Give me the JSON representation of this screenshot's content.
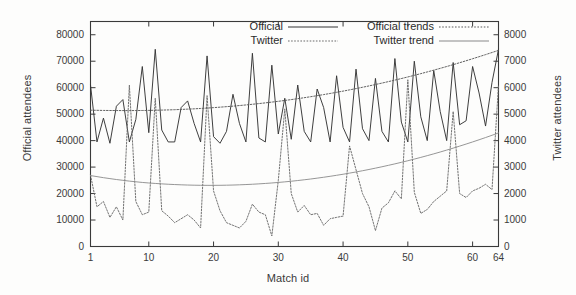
{
  "chart_data": {
    "type": "line",
    "title": "",
    "xlabel": "Match id",
    "ylabel": "Official attendees",
    "ylabel_right": "Twitter attendees",
    "xlim": [
      1,
      64
    ],
    "ylim": [
      0,
      85000
    ],
    "ylim_right": [
      0,
      8500
    ],
    "grid": false,
    "legend_position": "top-center-inside",
    "xticks": [
      1,
      10,
      20,
      30,
      40,
      50,
      60,
      64
    ],
    "xticklabels": [
      "1",
      "10",
      "20",
      "30",
      "40",
      "50",
      "60",
      "64"
    ],
    "yticks_left": [
      0,
      10000,
      20000,
      30000,
      40000,
      50000,
      60000,
      70000,
      80000
    ],
    "yticklabels_left": [
      "0",
      "10000",
      "20000",
      "30000",
      "40000",
      "50000",
      "60000",
      "70000",
      "80000"
    ],
    "yticks_right": [
      0,
      1000,
      2000,
      3000,
      4000,
      5000,
      6000,
      7000,
      8000
    ],
    "yticklabels_right": [
      "0",
      "1000",
      "2000",
      "3000",
      "4000",
      "5000",
      "6000",
      "7000",
      "8000"
    ],
    "x": [
      1,
      2,
      3,
      4,
      5,
      6,
      7,
      8,
      9,
      10,
      11,
      12,
      13,
      14,
      15,
      16,
      17,
      18,
      19,
      20,
      21,
      22,
      23,
      24,
      25,
      26,
      27,
      28,
      29,
      30,
      31,
      32,
      33,
      34,
      35,
      36,
      37,
      38,
      39,
      40,
      41,
      42,
      43,
      44,
      45,
      46,
      47,
      48,
      49,
      50,
      51,
      52,
      53,
      54,
      55,
      56,
      57,
      58,
      59,
      60,
      61,
      62,
      63,
      64
    ],
    "series": [
      {
        "name": "Official",
        "axis": "left",
        "style": "solid",
        "values": [
          61000,
          39500,
          48500,
          39000,
          53000,
          55500,
          39500,
          48000,
          68000,
          43000,
          74500,
          44000,
          39500,
          39500,
          52500,
          55000,
          46500,
          39500,
          72000,
          41500,
          39000,
          43500,
          57500,
          46500,
          39500,
          73000,
          41000,
          39500,
          68500,
          42500,
          56000,
          40500,
          61000,
          43500,
          39500,
          59500,
          52500,
          39500,
          64500,
          45000,
          39500,
          67000,
          44500,
          40000,
          63500,
          43500,
          39500,
          71000,
          47000,
          39500,
          70000,
          49000,
          40000,
          66500,
          51000,
          40000,
          69500,
          46000,
          47500,
          68000,
          58000,
          45500,
          62000,
          74500
        ]
      },
      {
        "name": "Twitter",
        "axis": "right",
        "style": "dotted",
        "values": [
          2700,
          1500,
          1700,
          1100,
          1500,
          1000,
          6100,
          1700,
          1200,
          1300,
          5600,
          1350,
          1150,
          900,
          1050,
          1200,
          1000,
          700,
          5700,
          2100,
          1350,
          900,
          800,
          700,
          950,
          1600,
          1300,
          1200,
          400,
          2500,
          5200,
          2000,
          1300,
          1550,
          1200,
          1250,
          800,
          1050,
          1100,
          1150,
          3800,
          2900,
          2000,
          1500,
          600,
          1450,
          1650,
          2100,
          1800,
          6300,
          2050,
          1250,
          1400,
          1700,
          1900,
          2100,
          5100,
          2000,
          1850,
          2100,
          2200,
          2350,
          2150,
          6100
        ]
      },
      {
        "name": "Official trends",
        "axis": "left",
        "style": "dotted",
        "values": [
          51500,
          51450,
          51400,
          51380,
          51360,
          51350,
          51350,
          51360,
          51380,
          51420,
          51470,
          51530,
          51600,
          51680,
          51780,
          51890,
          52010,
          52150,
          52300,
          52460,
          52640,
          52830,
          53030,
          53250,
          53480,
          53730,
          53990,
          54260,
          54550,
          54850,
          55170,
          55500,
          55850,
          56210,
          56590,
          56980,
          57390,
          57810,
          58250,
          58700,
          59170,
          59650,
          60150,
          60660,
          61190,
          61730,
          62290,
          62860,
          63450,
          64050,
          64670,
          65300,
          65950,
          66620,
          67300,
          67990,
          68700,
          69430,
          70170,
          70930,
          71700,
          72490,
          73290,
          74100
        ]
      },
      {
        "name": "Twitter trend",
        "axis": "right",
        "style": "solid-thin",
        "values": [
          2680,
          2640,
          2600,
          2565,
          2530,
          2500,
          2470,
          2445,
          2420,
          2400,
          2382,
          2366,
          2352,
          2340,
          2330,
          2322,
          2316,
          2312,
          2310,
          2310,
          2312,
          2316,
          2322,
          2330,
          2340,
          2352,
          2366,
          2382,
          2400,
          2420,
          2442,
          2466,
          2492,
          2520,
          2550,
          2582,
          2616,
          2652,
          2690,
          2730,
          2772,
          2816,
          2862,
          2910,
          2960,
          3012,
          3066,
          3122,
          3180,
          3240,
          3302,
          3366,
          3432,
          3500,
          3570,
          3642,
          3716,
          3792,
          3870,
          3950,
          4032,
          4116,
          4202,
          4290
        ]
      }
    ],
    "legend": [
      {
        "label": "Official",
        "style": "solid"
      },
      {
        "label": "Twitter",
        "style": "dotted"
      },
      {
        "label": "Official trends",
        "style": "dotted"
      },
      {
        "label": "Twitter trend",
        "style": "solid-thin"
      }
    ],
    "colors": {
      "axis": "#3a3a3a",
      "official": "#353535",
      "twitter": "#6b6b6b",
      "official_trend": "#5a5a5a",
      "twitter_trend": "#8a8a8a",
      "background": "#fdfdfc"
    }
  }
}
